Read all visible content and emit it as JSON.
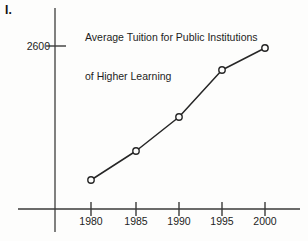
{
  "problem": {
    "label": "I."
  },
  "chart_data": {
    "type": "line",
    "title": "Average Tuition for Public Institutions of Higher Learning",
    "title_lines": [
      "Average Tuition for Public Institutions",
      "of Higher Learning"
    ],
    "xlabel": "",
    "ylabel": "",
    "categories": [
      "1980",
      "1985",
      "1990",
      "1995",
      "2000"
    ],
    "x": [
      1980,
      1985,
      1990,
      1995,
      2000
    ],
    "values": [
      1100,
      1450,
      1850,
      2420,
      2680
    ],
    "y_tick_labels": [
      "2600"
    ],
    "y_ticks": [
      2600
    ],
    "x_tick_labels": [
      "1980",
      "1985",
      "1990",
      "1995",
      "2000"
    ],
    "grid": false,
    "legend": null,
    "marker": "open-circle",
    "line_color": "#262626",
    "axis_color": "#4a4a4a",
    "points_px": [
      {
        "label": "1980",
        "x": 91,
        "y": 180
      },
      {
        "label": "1985",
        "x": 136,
        "y": 151
      },
      {
        "label": "1990",
        "x": 179,
        "y": 117
      },
      {
        "label": "1995",
        "x": 222,
        "y": 70
      },
      {
        "label": "2000",
        "x": 265,
        "y": 48
      }
    ],
    "axes_px": {
      "y_axis_x": 55,
      "y_axis_top": 8,
      "y_axis_bottom": 232,
      "x_axis_y": 209,
      "x_axis_left": 18,
      "x_axis_right": 300,
      "y_tick_2600_y": 46,
      "x_tick_xs": [
        91,
        136,
        179,
        222,
        265
      ]
    }
  }
}
